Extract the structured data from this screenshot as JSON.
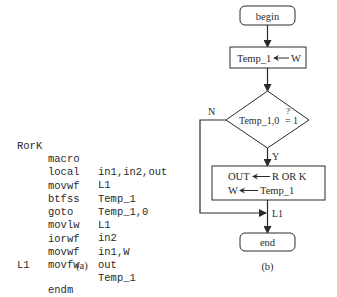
{
  "code_listing": {
    "lines": [
      {
        "label": "RorK",
        "mnemonic": "macro",
        "operands": "in1,in2,out"
      },
      {
        "label": "",
        "mnemonic": "local",
        "operands": "L1"
      },
      {
        "label": "",
        "mnemonic": "movwf",
        "operands": "Temp_1"
      },
      {
        "label": "",
        "mnemonic": "btfss",
        "operands": "Temp_1,0"
      },
      {
        "label": "",
        "mnemonic": "goto",
        "operands": "L1"
      },
      {
        "label": "",
        "mnemonic": "movlw",
        "operands": "in2"
      },
      {
        "label": "",
        "mnemonic": "iorwf",
        "operands": "in1,W"
      },
      {
        "label": "",
        "mnemonic": "movwf",
        "operands": "out"
      },
      {
        "label": "",
        "mnemonic": "movfw",
        "operands": "Temp_1"
      },
      {
        "label": "L1",
        "mnemonic": "",
        "operands": ""
      },
      {
        "label": "",
        "mnemonic": "endm",
        "operands": ""
      }
    ],
    "caption": "(a)"
  },
  "flowchart": {
    "begin": "begin",
    "assign_box": {
      "left": "Temp_1",
      "right": "W"
    },
    "decision": {
      "text": "Temp_1,0",
      "compare": "=",
      "question": "?",
      "value": "1"
    },
    "branch_no": "N",
    "branch_yes": "Y",
    "process_box": {
      "line1_left": "OUT",
      "line1_right": "R OR K",
      "line2_left": "W",
      "line2_right": "Temp_1"
    },
    "junction_label": "L1",
    "end": "end",
    "caption": "(b)"
  },
  "colors": {
    "stroke": "#2a2a2a",
    "text": "#2a2a2a",
    "background": "#ffffff"
  }
}
